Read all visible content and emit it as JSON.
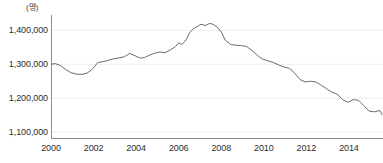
{
  "chart_data": {
    "type": "line",
    "title": "",
    "subtitle": "",
    "xlabel": "",
    "ylabel": "",
    "unit_label": "(명)",
    "grid": true,
    "legend": null,
    "legend_position": "none",
    "line_color": "#6b6b6b",
    "axis_color": "#8c8c8c",
    "grid_color": "#ededed",
    "text_color": "#2e2e2e",
    "xlim": [
      2000.0,
      2015.6
    ],
    "ylim": [
      1080000,
      1445000
    ],
    "ytick_values": [
      1100000,
      1200000,
      1300000,
      1400000
    ],
    "ytick_labels": [
      "1,100,000",
      "1,200,000",
      "1,300,000",
      "1,400,000"
    ],
    "xtick_values": [
      2000,
      2002,
      2004,
      2006,
      2008,
      2010,
      2012,
      2014
    ],
    "xtick_labels": [
      "2000",
      "2002",
      "2004",
      "2006",
      "2008",
      "2010",
      "2012",
      "2014"
    ],
    "series": [
      {
        "name": "population",
        "x": [
          2000.0,
          2000.2,
          2000.45,
          2000.7,
          2000.95,
          2001.2,
          2001.45,
          2001.7,
          2001.95,
          2002.2,
          2002.45,
          2002.6,
          2002.75,
          2002.95,
          2003.2,
          2003.45,
          2003.7,
          2003.95,
          2004.2,
          2004.4,
          2004.6,
          2004.85,
          2005.1,
          2005.35,
          2005.6,
          2005.85,
          2006.0,
          2006.15,
          2006.35,
          2006.5,
          2006.7,
          2006.9,
          2007.05,
          2007.25,
          2007.45,
          2007.6,
          2007.8,
          2008.0,
          2008.2,
          2008.45,
          2008.7,
          2008.95,
          2009.2,
          2009.45,
          2009.7,
          2009.95,
          2010.2,
          2010.45,
          2010.7,
          2010.95,
          2011.2,
          2011.45,
          2011.7,
          2011.95,
          2012.2,
          2012.45,
          2012.7,
          2012.95,
          2013.2,
          2013.45,
          2013.7,
          2013.95,
          2014.2,
          2014.45,
          2014.7,
          2014.95,
          2015.2,
          2015.45,
          2015.55
        ],
        "values": [
          1300000,
          1302000,
          1296000,
          1284000,
          1275000,
          1271000,
          1270000,
          1274000,
          1286000,
          1305000,
          1308000,
          1310000,
          1313000,
          1316000,
          1319000,
          1322000,
          1332000,
          1325000,
          1318000,
          1320000,
          1326000,
          1332000,
          1336000,
          1334000,
          1342000,
          1352000,
          1363000,
          1358000,
          1372000,
          1392000,
          1405000,
          1412000,
          1418000,
          1414000,
          1420000,
          1418000,
          1410000,
          1395000,
          1370000,
          1358000,
          1356000,
          1355000,
          1352000,
          1340000,
          1326000,
          1315000,
          1310000,
          1305000,
          1298000,
          1292000,
          1288000,
          1274000,
          1255000,
          1248000,
          1250000,
          1248000,
          1238000,
          1228000,
          1218000,
          1212000,
          1196000,
          1188000,
          1196000,
          1194000,
          1178000,
          1162000,
          1160000,
          1164000,
          1152000
        ]
      }
    ]
  }
}
